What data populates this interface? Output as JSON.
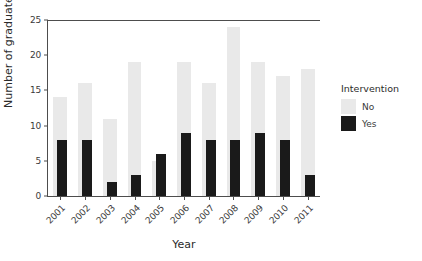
{
  "chart_data": {
    "type": "bar",
    "title": "",
    "xlabel": "Year",
    "ylabel": "Number of graduates",
    "categories": [
      "2001",
      "2002",
      "2003",
      "2004",
      "2005",
      "2006",
      "2007",
      "2008",
      "2009",
      "2010",
      "2011"
    ],
    "series": [
      {
        "name": "No",
        "color": "#e9e9e9",
        "values": [
          14,
          16,
          11,
          19,
          5,
          19,
          16,
          24,
          19,
          17,
          18
        ]
      },
      {
        "name": "Yes",
        "color": "#1a1a1a",
        "values": [
          8,
          8,
          2,
          3,
          6,
          9,
          8,
          8,
          9,
          8,
          3
        ]
      }
    ],
    "ylim": [
      0,
      25
    ],
    "yticks": [
      0,
      5,
      10,
      15,
      20,
      25
    ],
    "ytick_labels": [
      "0",
      "5",
      "10",
      "15",
      "20",
      "25"
    ],
    "grid": false,
    "legend_position": "right",
    "legend_title": "Intervention",
    "bar_style": "overlaid"
  },
  "legend": {
    "title": "Intervention",
    "entries": [
      {
        "label": "No",
        "color": "#e9e9e9"
      },
      {
        "label": "Yes",
        "color": "#1a1a1a"
      }
    ]
  },
  "axes": {
    "x_label": "Year",
    "y_label": "Number of graduates"
  }
}
